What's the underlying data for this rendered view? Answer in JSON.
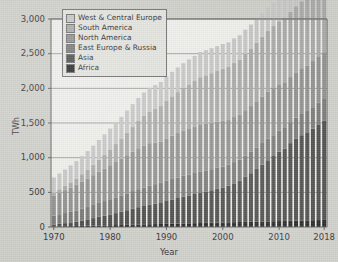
{
  "chart_data": {
    "type": "bar",
    "stacked": true,
    "title": "",
    "xlabel": "Year",
    "ylabel": "TWh",
    "ylim": [
      0,
      3000
    ],
    "yticks": [
      0,
      500,
      1000,
      1500,
      2000,
      2500,
      3000
    ],
    "ytick_labels": [
      "0",
      "500",
      "1,000",
      "1,500",
      "2,000",
      "2,500",
      "3,000"
    ],
    "xticks": [
      1970,
      1980,
      1990,
      2000,
      2010,
      2018
    ],
    "xtick_labels": [
      "1970",
      "1980",
      "1990",
      "2000",
      "2010",
      "2018"
    ],
    "grid": true,
    "legend_position": "upper-left-inside",
    "categories": [
      1970,
      1971,
      1972,
      1973,
      1974,
      1975,
      1976,
      1977,
      1978,
      1979,
      1980,
      1981,
      1982,
      1983,
      1984,
      1985,
      1986,
      1987,
      1988,
      1989,
      1990,
      1991,
      1992,
      1993,
      1994,
      1995,
      1996,
      1997,
      1998,
      1999,
      2000,
      2001,
      2002,
      2003,
      2004,
      2005,
      2006,
      2007,
      2008,
      2009,
      2010,
      2011,
      2012,
      2013,
      2014,
      2015,
      2016,
      2017,
      2018
    ],
    "series": [
      {
        "name": "Africa",
        "color": "#1e1e1e",
        "values": [
          5,
          8,
          10,
          12,
          14,
          16,
          18,
          20,
          22,
          24,
          26,
          28,
          30,
          32,
          34,
          36,
          38,
          40,
          42,
          44,
          46,
          48,
          50,
          52,
          54,
          56,
          58,
          60,
          62,
          64,
          66,
          68,
          70,
          72,
          74,
          76,
          78,
          80,
          82,
          84,
          86,
          88,
          90,
          92,
          94,
          96,
          98,
          100,
          102
        ]
      },
      {
        "name": "Asia",
        "color": "#474747",
        "values": [
          30,
          38,
          46,
          55,
          65,
          78,
          92,
          108,
          125,
          140,
          155,
          172,
          190,
          210,
          232,
          250,
          265,
          280,
          296,
          312,
          330,
          350,
          368,
          386,
          402,
          420,
          438,
          452,
          468,
          486,
          505,
          530,
          560,
          600,
          650,
          700,
          760,
          820,
          880,
          940,
          1000,
          1040,
          1120,
          1180,
          1230,
          1270,
          1320,
          1380,
          1430
        ]
      },
      {
        "name": "East Europe & Russia",
        "color": "#767676",
        "values": [
          130,
          138,
          145,
          152,
          160,
          170,
          180,
          190,
          200,
          210,
          220,
          228,
          236,
          244,
          252,
          260,
          268,
          274,
          280,
          286,
          292,
          295,
          297,
          300,
          302,
          304,
          306,
          305,
          304,
          303,
          302,
          304,
          306,
          300,
          305,
          308,
          310,
          312,
          314,
          300,
          302,
          300,
          302,
          304,
          306,
          308,
          310,
          312,
          314
        ]
      },
      {
        "name": "North America",
        "color": "#8e8e8e",
        "values": [
          290,
          310,
          330,
          350,
          370,
          390,
          410,
          430,
          450,
          470,
          490,
          510,
          530,
          550,
          570,
          590,
          605,
          615,
          600,
          590,
          610,
          625,
          640,
          655,
          665,
          670,
          680,
          675,
          670,
          665,
          660,
          640,
          650,
          645,
          655,
          660,
          665,
          670,
          675,
          680,
          670,
          660,
          650,
          655,
          660,
          650,
          665,
          670,
          675
        ]
      },
      {
        "name": "South America",
        "color": "#a8a8a8",
        "values": [
          40,
          50,
          62,
          75,
          90,
          108,
          128,
          150,
          175,
          200,
          228,
          258,
          290,
          325,
          360,
          395,
          428,
          458,
          486,
          512,
          540,
          566,
          590,
          612,
          634,
          656,
          678,
          696,
          714,
          732,
          750,
          766,
          782,
          798,
          814,
          830,
          846,
          862,
          878,
          894,
          910,
          924,
          938,
          952,
          966,
          980,
          994,
          1008,
          1022
        ]
      },
      {
        "name": "West & Central Europe",
        "color": "#c6c6c6",
        "values": [
          220,
          228,
          236,
          244,
          252,
          260,
          268,
          276,
          284,
          292,
          300,
          306,
          312,
          318,
          324,
          330,
          336,
          340,
          344,
          348,
          352,
          354,
          356,
          358,
          360,
          362,
          364,
          362,
          360,
          358,
          356,
          354,
          352,
          350,
          348,
          346,
          344,
          342,
          340,
          338,
          336,
          334,
          332,
          330,
          328,
          326,
          324,
          322,
          320
        ]
      }
    ],
    "totals": [
      715,
      772,
      829,
      888,
      951,
      1022,
      1096,
      1174,
      1256,
      1336,
      1419,
      1502,
      1588,
      1679,
      1772,
      1861,
      1940,
      2009,
      2048,
      2092,
      2170,
      2238,
      2301,
      2363,
      2417,
      2468,
      2524,
      2550,
      2578,
      2608,
      2639,
      2662,
      2720,
      2765,
      2846,
      2920,
      3003,
      3086,
      3169,
      3236,
      3304,
      3346,
      3432,
      3513,
      3584,
      3630,
      3711,
      3792,
      3863
    ]
  },
  "legend": {
    "items": [
      {
        "label": "West & Central Europe",
        "color": "#c6c6c6"
      },
      {
        "label": "South America",
        "color": "#a8a8a8"
      },
      {
        "label": "North America",
        "color": "#8e8e8e"
      },
      {
        "label": "East Europe & Russia",
        "color": "#767676"
      },
      {
        "label": "Asia",
        "color": "#474747"
      },
      {
        "label": "Africa",
        "color": "#1e1e1e"
      }
    ]
  },
  "axes": {
    "y_title": "TWh",
    "x_title": "Year"
  }
}
